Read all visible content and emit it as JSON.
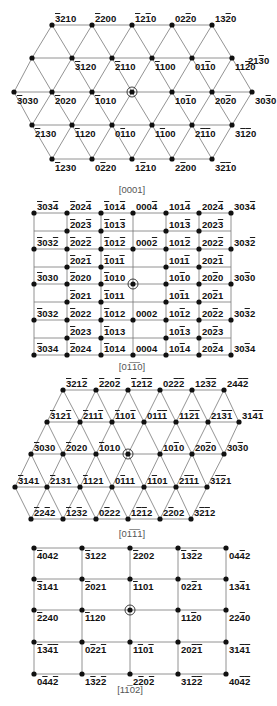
{
  "figure": {
    "panels": [
      {
        "zone_axis": "[0001]",
        "pattern": "hexagonal",
        "rows": [
          {
            "y": 25,
            "points": [
              {
                "x": 52,
                "label": "-3210"
              },
              {
                "x": 92,
                "label": "-2200"
              },
              {
                "x": 132,
                "label": "-12-10"
              },
              {
                "x": 172,
                "label": "02-20"
              },
              {
                "x": 212,
                "label": "13-20"
              }
            ]
          },
          {
            "y": 58,
            "points": [
              {
                "x": 32,
                "label": ""
              },
              {
                "x": 72,
                "label": "-3120"
              },
              {
                "x": 112,
                "label": "-2110"
              },
              {
                "x": 152,
                "label": "-1100"
              },
              {
                "x": 192,
                "label": "01-10"
              },
              {
                "x": 232,
                "label": "11-20"
              }
            ],
            "extra_label": {
              "x": 248,
              "label": "21-30"
            }
          },
          {
            "y": 92,
            "points": [
              {
                "x": 14,
                "label": "-3030"
              },
              {
                "x": 52,
                "label": "-2020"
              },
              {
                "x": 92,
                "label": "-1010"
              },
              {
                "x": 132,
                "label": "",
                "center": true
              },
              {
                "x": 172,
                "label": "10-10"
              },
              {
                "x": 212,
                "label": "20-20"
              },
              {
                "x": 252,
                "label": "30-30"
              }
            ]
          },
          {
            "y": 125,
            "points": [
              {
                "x": 32,
                "label": "-2130"
              },
              {
                "x": 72,
                "label": "-1120"
              },
              {
                "x": 112,
                "label": "0-110"
              },
              {
                "x": 152,
                "label": "1-100"
              },
              {
                "x": 192,
                "label": "2-1-10"
              },
              {
                "x": 232,
                "label": "3-1-20"
              }
            ]
          },
          {
            "y": 159,
            "points": [
              {
                "x": 52,
                "label": "-1230"
              },
              {
                "x": 92,
                "label": "0-220"
              },
              {
                "x": 132,
                "label": "1-210"
              },
              {
                "x": 172,
                "label": "2-200"
              },
              {
                "x": 212,
                "label": "3-2-10"
              }
            ]
          }
        ]
      },
      {
        "zone_axis": "[01-10]",
        "pattern": "rectangular",
        "columns_x": [
          34,
          67,
          101,
          133,
          166,
          199,
          231
        ],
        "rows_y": [
          213,
          231,
          249,
          267,
          284,
          302,
          320,
          338,
          355
        ],
        "labels": [
          {
            "row": 0,
            "col": 0,
            "label": "-303-4"
          },
          {
            "row": 0,
            "col": 1,
            "label": "-202-4"
          },
          {
            "row": 0,
            "col": 2,
            "label": "-101-4"
          },
          {
            "row": 0,
            "col": 3,
            "label": "000-4"
          },
          {
            "row": 0,
            "col": 4,
            "label": "101-4"
          },
          {
            "row": 0,
            "col": 5,
            "label": "202-4"
          },
          {
            "row": 0,
            "col": 6,
            "label": "303-4"
          },
          {
            "row": 1,
            "col": 1,
            "label": "-202-3"
          },
          {
            "row": 1,
            "col": 2,
            "label": "-101-3"
          },
          {
            "row": 1,
            "col": 4,
            "label": "101-3"
          },
          {
            "row": 1,
            "col": 5,
            "label": "202-3"
          },
          {
            "row": 2,
            "col": 0,
            "label": "-303-2"
          },
          {
            "row": 2,
            "col": 1,
            "label": "-202-2"
          },
          {
            "row": 2,
            "col": 2,
            "label": "-101-2"
          },
          {
            "row": 2,
            "col": 3,
            "label": "000-2"
          },
          {
            "row": 2,
            "col": 4,
            "label": "101-2"
          },
          {
            "row": 2,
            "col": 5,
            "label": "202-2"
          },
          {
            "row": 2,
            "col": 6,
            "label": "303-2"
          },
          {
            "row": 3,
            "col": 1,
            "label": "-202-1"
          },
          {
            "row": 3,
            "col": 2,
            "label": "-101-1"
          },
          {
            "row": 3,
            "col": 4,
            "label": "101-1"
          },
          {
            "row": 3,
            "col": 5,
            "label": "202-1"
          },
          {
            "row": 4,
            "col": 0,
            "label": "-3030"
          },
          {
            "row": 4,
            "col": 1,
            "label": "-2020"
          },
          {
            "row": 4,
            "col": 2,
            "label": "-1010"
          },
          {
            "row": 4,
            "col": 3,
            "label": "",
            "center": true
          },
          {
            "row": 4,
            "col": 4,
            "label": "10-10"
          },
          {
            "row": 4,
            "col": 5,
            "label": "20-20"
          },
          {
            "row": 4,
            "col": 6,
            "label": "30-30"
          },
          {
            "row": 5,
            "col": 1,
            "label": "-2021"
          },
          {
            "row": 5,
            "col": 2,
            "label": "-1011"
          },
          {
            "row": 5,
            "col": 4,
            "label": "10-11"
          },
          {
            "row": 5,
            "col": 5,
            "label": "20-21"
          },
          {
            "row": 6,
            "col": 0,
            "label": "-3032"
          },
          {
            "row": 6,
            "col": 1,
            "label": "-2022"
          },
          {
            "row": 6,
            "col": 2,
            "label": "-1012"
          },
          {
            "row": 6,
            "col": 3,
            "label": "0002"
          },
          {
            "row": 6,
            "col": 4,
            "label": "10-12"
          },
          {
            "row": 6,
            "col": 5,
            "label": "20-22"
          },
          {
            "row": 6,
            "col": 6,
            "label": "30-32"
          },
          {
            "row": 7,
            "col": 1,
            "label": "-2023"
          },
          {
            "row": 7,
            "col": 2,
            "label": "-1013"
          },
          {
            "row": 7,
            "col": 4,
            "label": "10-13"
          },
          {
            "row": 7,
            "col": 5,
            "label": "20-23"
          },
          {
            "row": 8,
            "col": 0,
            "label": "-3034"
          },
          {
            "row": 8,
            "col": 1,
            "label": "-2024"
          },
          {
            "row": 8,
            "col": 2,
            "label": "-1014"
          },
          {
            "row": 8,
            "col": 3,
            "label": "0004"
          },
          {
            "row": 8,
            "col": 4,
            "label": "10-14"
          },
          {
            "row": 8,
            "col": 5,
            "label": "20-24"
          },
          {
            "row": 8,
            "col": 6,
            "label": "30-34"
          }
        ]
      },
      {
        "zone_axis": "[0-111]",
        "pattern": "hexagonal",
        "rows": [
          {
            "y": 390,
            "points": [
              {
                "x": 63,
                "label": "-321-2"
              },
              {
                "x": 96,
                "label": "-220-2"
              },
              {
                "x": 128,
                "label": "-12-1-2"
              },
              {
                "x": 160,
                "label": "02-2-2"
              },
              {
                "x": 192,
                "label": "12-3-2"
              },
              {
                "x": 224,
                "label": "24-4-2"
              }
            ]
          },
          {
            "y": 422,
            "points": [
              {
                "x": 47,
                "label": "-312-1"
              },
              {
                "x": 80,
                "label": "-211-1"
              },
              {
                "x": 112,
                "label": "-110-1"
              },
              {
                "x": 144,
                "label": "01-1-1"
              },
              {
                "x": 176,
                "label": "11-2-1"
              },
              {
                "x": 208,
                "label": "21-3-1"
              },
              {
                "x": 239,
                "label": "31-4-1"
              }
            ]
          },
          {
            "y": 454,
            "points": [
              {
                "x": 31,
                "label": "-3030"
              },
              {
                "x": 63,
                "label": "-2020"
              },
              {
                "x": 96,
                "label": "-1010"
              },
              {
                "x": 128,
                "label": "",
                "center": true
              },
              {
                "x": 160,
                "label": "10-10"
              },
              {
                "x": 192,
                "label": "20-20"
              },
              {
                "x": 224,
                "label": "30-30"
              }
            ]
          },
          {
            "y": 487,
            "points": [
              {
                "x": 15,
                "label": "-3141"
              },
              {
                "x": 47,
                "label": "-2131"
              },
              {
                "x": 80,
                "label": "-1121"
              },
              {
                "x": 112,
                "label": "0-111"
              },
              {
                "x": 144,
                "label": "1-101"
              },
              {
                "x": 176,
                "label": "2-1-11"
              },
              {
                "x": 207,
                "label": "3-1-21"
              }
            ]
          },
          {
            "y": 519,
            "points": [
              {
                "x": 31,
                "label": "-22-42"
              },
              {
                "x": 63,
                "label": "-12-32"
              },
              {
                "x": 96,
                "label": "0-222"
              },
              {
                "x": 128,
                "label": "1-2-12"
              },
              {
                "x": 160,
                "label": "2-202"
              },
              {
                "x": 191,
                "label": "3-2-12"
              }
            ]
          }
        ]
      },
      {
        "zone_axis": "[1-102]",
        "pattern": "rectangular",
        "columns_x": [
          34,
          82,
          130,
          178,
          226
        ],
        "rows_y": [
          548,
          579,
          610,
          642,
          674
        ],
        "labels": [
          {
            "row": 0,
            "col": 0,
            "label": "-4042"
          },
          {
            "row": 0,
            "col": 1,
            "label": "-3122"
          },
          {
            "row": 0,
            "col": 2,
            "label": "-2202"
          },
          {
            "row": 0,
            "col": 3,
            "label": "-13-22"
          },
          {
            "row": 0,
            "col": 4,
            "label": "04-42"
          },
          {
            "row": 1,
            "col": 0,
            "label": "-3141"
          },
          {
            "row": 1,
            "col": 1,
            "label": "-2021"
          },
          {
            "row": 1,
            "col": 2,
            "label": "-1101"
          },
          {
            "row": 1,
            "col": 3,
            "label": "02-21"
          },
          {
            "row": 1,
            "col": 4,
            "label": "13-41"
          },
          {
            "row": 2,
            "col": 0,
            "label": "-2240"
          },
          {
            "row": 2,
            "col": 1,
            "label": "-1120"
          },
          {
            "row": 2,
            "col": 2,
            "label": "",
            "center": true
          },
          {
            "row": 2,
            "col": 3,
            "label": "11-20"
          },
          {
            "row": 2,
            "col": 4,
            "label": "22-40"
          },
          {
            "row": 3,
            "col": 0,
            "label": "-13-4-1"
          },
          {
            "row": 3,
            "col": 1,
            "label": "0-22-1"
          },
          {
            "row": 3,
            "col": 2,
            "label": "1-10-1"
          },
          {
            "row": 3,
            "col": 3,
            "label": "20-2-1"
          },
          {
            "row": 3,
            "col": 4,
            "label": "31-4-1"
          },
          {
            "row": 4,
            "col": 0,
            "label": "0-44-2"
          },
          {
            "row": 4,
            "col": 1,
            "label": "1-32-2"
          },
          {
            "row": 4,
            "col": 2,
            "label": "2-20-2"
          },
          {
            "row": 4,
            "col": 3,
            "label": "31-2-2"
          },
          {
            "row": 4,
            "col": 4,
            "label": "40-4-2"
          }
        ]
      }
    ],
    "captions": {
      "p1": "[0001]",
      "p2": "[01̅1̅0]",
      "p3": "[01̅1̅1]",
      "p4": "[11̅02]"
    }
  }
}
